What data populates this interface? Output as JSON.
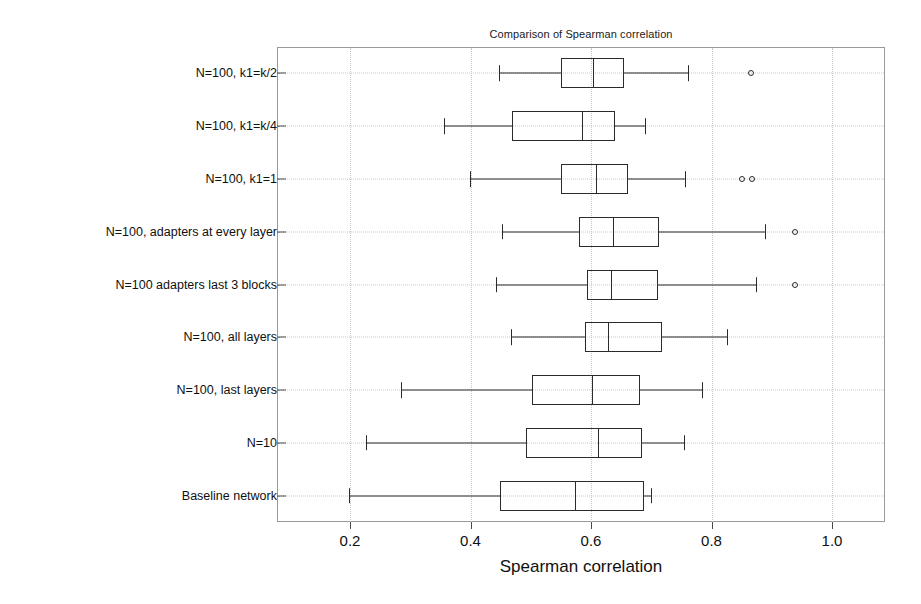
{
  "chart_data": {
    "type": "box",
    "title": "Comparison of Spearman correlation",
    "xlabel": "Spearman correlation",
    "ylabel": "",
    "xlim": [
      0.08,
      1.09
    ],
    "xticks": [
      0.2,
      0.4,
      0.6,
      0.8,
      1.0
    ],
    "xticklabels": [
      "0.2",
      "0.4",
      "0.6",
      "0.8",
      "1.0"
    ],
    "grid": true,
    "orientation": "horizontal",
    "legend": null,
    "categories": [
      "N=100,  k1=k/2",
      "N=100, k1=k/4",
      "N=100, k1=1",
      "N=100, adapters at every layer",
      "N=100 adapters last 3 blocks",
      "N=100, all layers",
      "N=100, last layers",
      "N=10",
      "Baseline network"
    ],
    "boxes": [
      {
        "label": "N=100,  k1=k/2",
        "whisker_low": 0.447,
        "q1": 0.551,
        "median": 0.604,
        "q3": 0.654,
        "whisker_high": 0.761,
        "outliers": [
          0.866
        ]
      },
      {
        "label": "N=100, k1=k/4",
        "whisker_low": 0.356,
        "q1": 0.469,
        "median": 0.585,
        "q3": 0.64,
        "whisker_high": 0.69,
        "outliers": []
      },
      {
        "label": "N=100, k1=1",
        "whisker_low": 0.399,
        "q1": 0.551,
        "median": 0.608,
        "q3": 0.661,
        "whisker_high": 0.756,
        "outliers": [
          0.851,
          0.867
        ]
      },
      {
        "label": "N=100, adapters at every layer",
        "whisker_low": 0.452,
        "q1": 0.58,
        "median": 0.637,
        "q3": 0.713,
        "whisker_high": 0.888,
        "outliers": [
          0.938
        ]
      },
      {
        "label": "N=100 adapters last 3 blocks",
        "whisker_low": 0.442,
        "q1": 0.593,
        "median": 0.634,
        "q3": 0.712,
        "whisker_high": 0.874,
        "outliers": [
          0.938
        ]
      },
      {
        "label": "N=100, all layers",
        "whisker_low": 0.467,
        "q1": 0.59,
        "median": 0.628,
        "q3": 0.718,
        "whisker_high": 0.826,
        "outliers": []
      },
      {
        "label": "N=100, last layers",
        "whisker_low": 0.285,
        "q1": 0.502,
        "median": 0.602,
        "q3": 0.681,
        "whisker_high": 0.784,
        "outliers": []
      },
      {
        "label": "N=10",
        "whisker_low": 0.227,
        "q1": 0.492,
        "median": 0.612,
        "q3": 0.685,
        "whisker_high": 0.754,
        "outliers": []
      },
      {
        "label": "Baseline network",
        "whisker_low": 0.199,
        "q1": 0.449,
        "median": 0.574,
        "q3": 0.688,
        "whisker_high": 0.7,
        "outliers": []
      }
    ],
    "colors": {
      "line": "#2b2b2b",
      "grid": "#c9c9c9",
      "frame": "#9a9a9a",
      "text": "#101010",
      "background": "#ffffff"
    }
  }
}
